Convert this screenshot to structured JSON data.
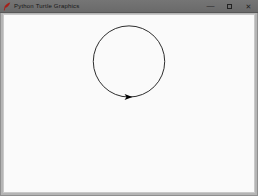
{
  "window": {
    "title": "Python Turtle Graphics",
    "icon": "tk-feather-icon",
    "controls": {
      "minimize_label": "—",
      "maximize_label": "",
      "close_label": "✕"
    },
    "titlebar_color": "#6e6e6e",
    "frame_color": "#b5b5b5"
  },
  "canvas": {
    "background": "#fafafa",
    "drawing": {
      "type": "turtle-graphics",
      "circle": {
        "cx": 126,
        "cy": 47,
        "r": 36,
        "stroke": "#2b2b2b",
        "stroke_width": 1,
        "fill": "none"
      },
      "turtle": {
        "shape": "arrowhead",
        "heading": "east",
        "x": 126,
        "y": 83,
        "color": "#000000",
        "points": "121.5,80 129.5,83 121.5,86 123.5,83"
      }
    }
  }
}
